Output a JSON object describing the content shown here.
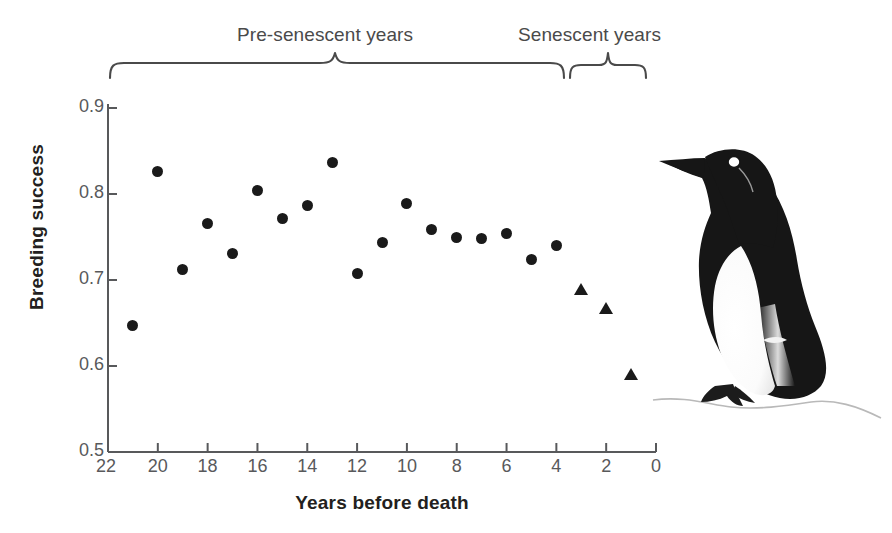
{
  "chart_data": {
    "type": "scatter",
    "title": "",
    "xlabel": "Years before death",
    "ylabel": "Breeding success",
    "xlim": [
      22,
      0
    ],
    "ylim": [
      0.5,
      0.9
    ],
    "x_ticks": [
      22,
      20,
      18,
      16,
      14,
      12,
      10,
      8,
      6,
      4,
      2,
      0
    ],
    "y_ticks": [
      0.5,
      0.6,
      0.7,
      0.8,
      0.9
    ],
    "x_tick_labels": [
      "22",
      "20",
      "18",
      "16",
      "14",
      "12",
      "10",
      "8",
      "6",
      "4",
      "2",
      "0"
    ],
    "y_tick_labels": [
      "0.5",
      "0.6",
      "0.7",
      "0.8",
      "0.9"
    ],
    "grid": false,
    "legend": "none",
    "axis_note": "x-axis is reversed: 22 years before death at left, 0 at right",
    "series": [
      {
        "name": "Pre-senescent years",
        "marker": "circle",
        "color": "#1a1a1a",
        "points": [
          {
            "x": 21,
            "y": 0.647
          },
          {
            "x": 20,
            "y": 0.826
          },
          {
            "x": 19,
            "y": 0.712
          },
          {
            "x": 18,
            "y": 0.766
          },
          {
            "x": 17,
            "y": 0.731
          },
          {
            "x": 16,
            "y": 0.804
          },
          {
            "x": 15,
            "y": 0.772
          },
          {
            "x": 14,
            "y": 0.787
          },
          {
            "x": 13,
            "y": 0.837
          },
          {
            "x": 12,
            "y": 0.708
          },
          {
            "x": 11,
            "y": 0.744
          },
          {
            "x": 10,
            "y": 0.789
          },
          {
            "x": 9,
            "y": 0.759
          },
          {
            "x": 8,
            "y": 0.749
          },
          {
            "x": 7,
            "y": 0.748
          },
          {
            "x": 6,
            "y": 0.754
          },
          {
            "x": 5,
            "y": 0.724
          },
          {
            "x": 4,
            "y": 0.74
          }
        ]
      },
      {
        "name": "Senescent years",
        "marker": "triangle",
        "color": "#1a1a1a",
        "points": [
          {
            "x": 3,
            "y": 0.69
          },
          {
            "x": 2,
            "y": 0.668
          },
          {
            "x": 1,
            "y": 0.591
          }
        ]
      }
    ],
    "annotations": [
      {
        "name": "pre-senescent-bracket",
        "label": "Pre-senescent years",
        "x_from": 22,
        "x_to": 3.8,
        "style": "curly-brace-top"
      },
      {
        "name": "senescent-bracket",
        "label": "Senescent years",
        "x_from": 3.5,
        "x_to": 0.5,
        "style": "curly-brace-top"
      },
      {
        "name": "bird-illustration",
        "label": "common guillemot",
        "style": "image"
      }
    ]
  },
  "annotations": {
    "pre_senescent_label": "Pre-senescent years",
    "senescent_label": "Senescent years"
  },
  "axes": {
    "x_title": "Years before death",
    "y_title": "Breeding success"
  },
  "colors": {
    "marker": "#1a1a1a",
    "axis": "#58595b",
    "label": "#231f20",
    "annotation": "#4a4a4a",
    "background": "#ffffff"
  },
  "illustration": {
    "name": "guillemot-illustration",
    "description": "common guillemot standing on rock"
  }
}
